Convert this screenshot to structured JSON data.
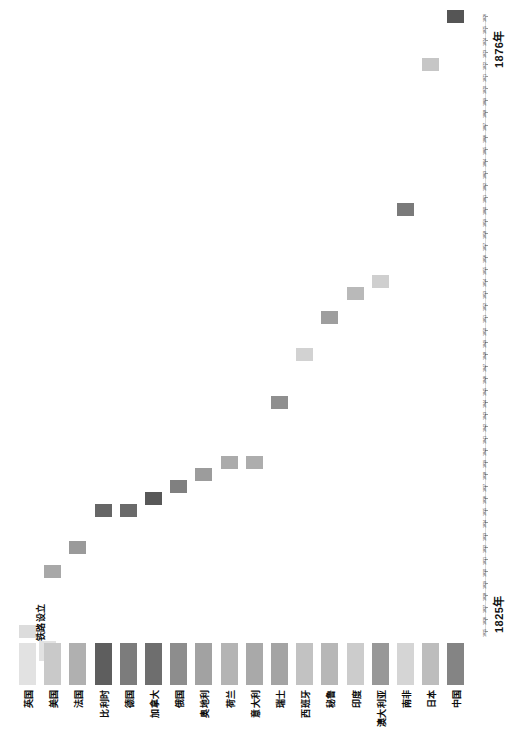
{
  "chart_data": {
    "type": "scatter",
    "title": "",
    "xlabel": "",
    "ylabel": "",
    "orientation": "rotated-90",
    "grid": false,
    "legend_position": "bottom-left",
    "series_name": "铁路设立",
    "axis_start_label": "1825年",
    "axis_end_label": "1876年",
    "ylim": [
      1825,
      1876
    ],
    "categories": [
      "英国",
      "美国",
      "法国",
      "比利时",
      "德国",
      "加拿大",
      "俄国",
      "奥地利",
      "荷兰",
      "意大利",
      "瑞士",
      "西班牙",
      "秘鲁",
      "印度",
      "澳大利亚",
      "南非",
      "日本",
      "中国"
    ],
    "values": [
      1825,
      1830,
      1832,
      1835,
      1835,
      1836,
      1837,
      1838,
      1839,
      1839,
      1844,
      1848,
      1851,
      1853,
      1854,
      1860,
      1872,
      1876
    ],
    "point_colors": [
      "#dcdcdc",
      "#a8a8a8",
      "#9a9a9a",
      "#666666",
      "#6a6a6a",
      "#585858",
      "#808080",
      "#9c9c9c",
      "#ababab",
      "#adadad",
      "#8f8f8f",
      "#d2d2d2",
      "#9e9e9e",
      "#b9b9b9",
      "#cfcfcf",
      "#7a7a7a",
      "#c6c6c6",
      "#555555"
    ],
    "swatch_colors": [
      "#e2e2e2",
      "#c9c9c9",
      "#b0b0b0",
      "#5e5e5e",
      "#7c7c7c",
      "#6e6e6e",
      "#8d8d8d",
      "#a2a2a2",
      "#b4b4b4",
      "#a9a9a9",
      "#a4a4a4",
      "#c2c2c2",
      "#b7b7b7",
      "#cccccc",
      "#989898",
      "#d5d5d5",
      "#bdbdbd",
      "#848484"
    ],
    "tick_years": [
      1825,
      1826,
      1827,
      1828,
      1829,
      1830,
      1831,
      1832,
      1833,
      1834,
      1835,
      1836,
      1837,
      1838,
      1839,
      1840,
      1841,
      1842,
      1843,
      1844,
      1845,
      1846,
      1847,
      1848,
      1849,
      1850,
      1851,
      1852,
      1853,
      1854,
      1855,
      1856,
      1857,
      1858,
      1859,
      1860,
      1861,
      1862,
      1863,
      1864,
      1865,
      1866,
      1867,
      1868,
      1869,
      1870,
      1871,
      1872,
      1873,
      1874,
      1875,
      1876
    ]
  },
  "legend": {
    "series_label": "铁路设立"
  },
  "axis": {
    "start": "1825年",
    "end": "1876年"
  }
}
